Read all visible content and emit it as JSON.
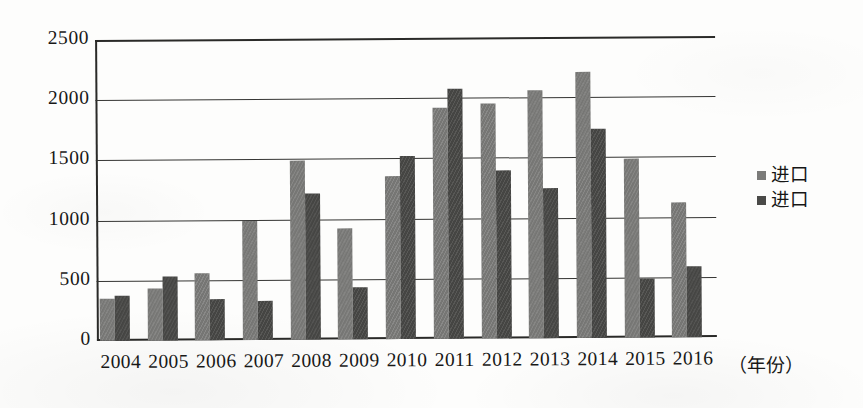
{
  "chart_data": {
    "type": "bar",
    "title": "",
    "subtitle": "",
    "xlabel": "（年份）",
    "ylabel": "",
    "ylim": [
      0,
      2500
    ],
    "ytick_step": 500,
    "ytick_labels": [
      "0",
      "500",
      "1000",
      "1500",
      "2000",
      "2500"
    ],
    "grid": true,
    "legend_position": "right",
    "categories": [
      "2004",
      "2005",
      "2006",
      "2007",
      "2008",
      "2009",
      "2010",
      "2011",
      "2012",
      "2013",
      "2014",
      "2015",
      "2016"
    ],
    "series": [
      {
        "name": "进口",
        "color": "#767674",
        "values": [
          350,
          435,
          555,
          990,
          1490,
          925,
          1350,
          1915,
          1950,
          2060,
          2210,
          1490,
          1120
        ]
      },
      {
        "name": "进口",
        "color": "#454543",
        "values": [
          375,
          535,
          340,
          320,
          1215,
          430,
          1520,
          2075,
          1395,
          1250,
          1735,
          490,
          590
        ]
      }
    ]
  },
  "legend": {
    "entries": [
      {
        "label": "进口",
        "swatch": "#7b7b79"
      },
      {
        "label": "进口",
        "swatch": "#4a4a48"
      }
    ]
  },
  "axis": {
    "x_title": "（年份）"
  }
}
